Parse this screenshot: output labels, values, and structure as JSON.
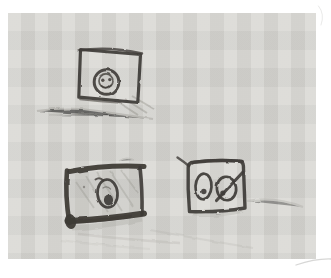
{
  "scene": {
    "type": "pencil-sketch-scan",
    "description": "Scanned charcoal pencil sketch on light gray paper with white scan margins. Three rough hand-drawn rectangular frames: a tilted square frame at top-center containing a circle with a small smiley face; a heavy dark rectangular frame at bottom-left containing an egg shape with a dark pit; a rounded square frame at bottom-right containing two egg shapes, the right one crossed by a diagonal slash. Soft smudged ground lines appear beneath each frame.",
    "colors": {
      "page": "#ffffff",
      "paper": "#d8d7d3",
      "charcoal": "#3e3b37",
      "charcoal-soft": "#6f6c66",
      "smudge": "#a3a19b",
      "artifact": "#9a9a98"
    },
    "elements": [
      {
        "name": "top-picture-frame",
        "shape": "tilted square frame",
        "content": "circle with smiley face inside",
        "position": "top center-left"
      },
      {
        "name": "bottom-left-picture-frame",
        "shape": "heavy dark rectangular frame with shaded interior",
        "content": "egg shape with curl at top and dark pit at bottom",
        "position": "bottom left"
      },
      {
        "name": "bottom-right-picture-frame",
        "shape": "rounded square frame with small tail stroke at top-left",
        "content": "two egg shapes, each with a dark dot; right egg crossed by a diagonal slash",
        "position": "bottom right"
      },
      {
        "name": "ground-smudges",
        "shape": "faint wavy smudge lines and shading",
        "content": "ground shadow under each frame",
        "position": "below frames"
      }
    ]
  }
}
